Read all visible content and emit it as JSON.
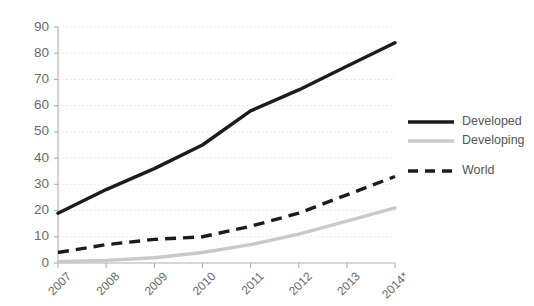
{
  "chart_data": {
    "type": "line",
    "title": "",
    "subtitle": "",
    "xlabel": "",
    "ylabel": "",
    "categories": [
      "2007",
      "2008",
      "2009",
      "2010",
      "2011",
      "2012",
      "2013",
      "2014*"
    ],
    "ylim": [
      0,
      90
    ],
    "yticks": [
      0,
      10,
      20,
      30,
      40,
      50,
      60,
      70,
      80,
      90
    ],
    "ytick_labels": [
      "0",
      "10",
      "20",
      "30",
      "40",
      "50",
      "60",
      "70",
      "80",
      "90"
    ],
    "grid": true,
    "grid_axis": "y",
    "legend_position": "right",
    "series": [
      {
        "name": "Developed",
        "style": "solid",
        "color": "#1c1c1c",
        "values": [
          19,
          28,
          36,
          45,
          58,
          66,
          75,
          84
        ]
      },
      {
        "name": "Developing",
        "style": "solid",
        "color": "#c9c9c9",
        "values": [
          0.5,
          1,
          2,
          4,
          7,
          11,
          16,
          21
        ]
      },
      {
        "name": "World",
        "style": "dashed",
        "color": "#1c1c1c",
        "values": [
          4,
          7,
          9,
          10,
          14,
          19,
          26,
          33
        ]
      }
    ]
  },
  "legend": {
    "items": [
      {
        "label": "Developed"
      },
      {
        "label": "Developing"
      },
      {
        "label": "World"
      }
    ]
  },
  "axes": {
    "y_tick_labels": [
      "90",
      "80",
      "70",
      "60",
      "50",
      "40",
      "30",
      "20",
      "10",
      "0"
    ],
    "x_tick_labels": [
      "2007",
      "2008",
      "2009",
      "2010",
      "2011",
      "2012",
      "2013",
      "2014*"
    ]
  }
}
